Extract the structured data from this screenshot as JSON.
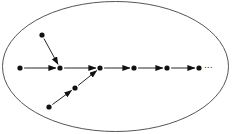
{
  "diagram": {
    "type": "directed-graph-in-ellipse",
    "boundary": {
      "shape": "ellipse",
      "cx": 115.5,
      "cy": 66.5,
      "rx": 113,
      "ry": 65,
      "stroke": "#555555"
    },
    "node_color": "#111111",
    "edge_color": "#111111",
    "nodes": [
      {
        "id": "a",
        "x": 20,
        "y": 68
      },
      {
        "id": "b",
        "x": 42,
        "y": 35
      },
      {
        "id": "c",
        "x": 60,
        "y": 68
      },
      {
        "id": "d",
        "x": 49,
        "y": 107
      },
      {
        "id": "e",
        "x": 75,
        "y": 88
      },
      {
        "id": "f",
        "x": 100,
        "y": 68
      },
      {
        "id": "g",
        "x": 134,
        "y": 68
      },
      {
        "id": "h",
        "x": 167,
        "y": 68
      },
      {
        "id": "i",
        "x": 199,
        "y": 68
      }
    ],
    "edges": [
      {
        "from": "a",
        "to": "c"
      },
      {
        "from": "b",
        "to": "c"
      },
      {
        "from": "c",
        "to": "f"
      },
      {
        "from": "d",
        "to": "e"
      },
      {
        "from": "e",
        "to": "f"
      },
      {
        "from": "f",
        "to": "g"
      },
      {
        "from": "g",
        "to": "h"
      },
      {
        "from": "h",
        "to": "i"
      }
    ],
    "continuation_label": "..."
  }
}
